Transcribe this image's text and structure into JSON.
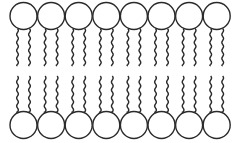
{
  "diagram": {
    "type": "phospholipid-bilayer",
    "molecules_per_leaflet": 8,
    "leaflets": [
      "top",
      "bottom"
    ],
    "stroke_color": "#2a2a2a",
    "fill_color": "#ffffff",
    "head_radius": 13.5,
    "head_spacing": 27.6,
    "first_head_x": 23.5,
    "top_head_y": 16,
    "bottom_head_y": 125,
    "tail_offset": 6,
    "top_tail_end_y": 66,
    "bottom_tail_start_y": 76
  }
}
